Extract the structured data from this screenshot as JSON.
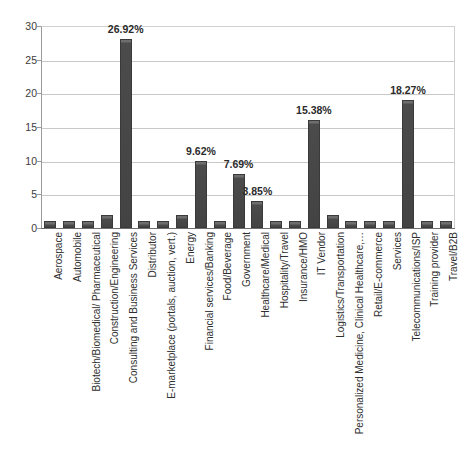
{
  "chart_data": {
    "type": "bar",
    "title": "",
    "subtitle": "",
    "xlabel": "",
    "ylabel": "",
    "ylim": [
      0,
      30
    ],
    "ytick_step": 5,
    "yticks": [
      30,
      25,
      20,
      15,
      10,
      5,
      0
    ],
    "grid": true,
    "legend": false,
    "legend_position": "none",
    "orientation": "vertical",
    "bar_color": "#4b4b4b",
    "categories": [
      "Aerospace",
      "Automobile",
      "Biotech/Biomedical/ Pharmaceutical",
      "Construction/Engineering",
      "Consulting and Business Services",
      "Distributor",
      "E-marketplace (portals, auction, vert.)",
      "Energy",
      "Financial services/Banking",
      "Food/Beverage",
      "Government",
      "Healthcare/Medical",
      "Hospitality/Travel",
      "Insurance/HMO",
      "IT Vendor",
      "Logistics/Transportation",
      "Personalized Medicine, Clinical Healthcare,…",
      "Retail/E-commerce",
      "Services",
      "Telecommunications/ISP",
      "Training provider",
      "Travel/B2B"
    ],
    "values": [
      1,
      1,
      1,
      2,
      28,
      1,
      1,
      2,
      10,
      1,
      8,
      4,
      1,
      1,
      16,
      2,
      1,
      1,
      1,
      19,
      1,
      1
    ],
    "data_labels": [
      "",
      "",
      "",
      "",
      "26.92%",
      "",
      "",
      "",
      "9.62%",
      "",
      "7.69%",
      "3.85%",
      "",
      "",
      "15.38%",
      "",
      "",
      "",
      "",
      "18.27%",
      "",
      ""
    ]
  }
}
